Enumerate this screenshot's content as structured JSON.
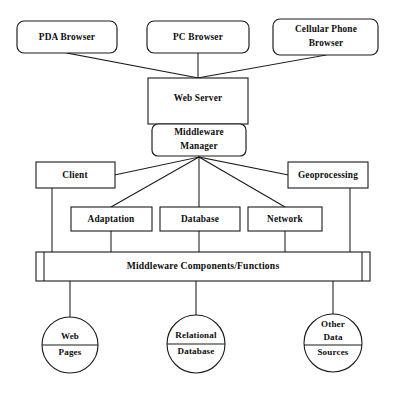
{
  "diagram": {
    "style": {
      "background": "#ffffff",
      "stroke": "#1a1a1a",
      "fill": "#ffffff",
      "text": "#0d0d0d"
    },
    "clients": [
      {
        "id": "pda-browser",
        "label": "PDA Browser",
        "shape": "rounded-rect"
      },
      {
        "id": "pc-browser",
        "label": "PC Browser",
        "shape": "rounded-rect"
      },
      {
        "id": "cellular-phone-browser",
        "label_line1": "Cellular Phone",
        "label_line2": "Browser",
        "shape": "rounded-rect"
      }
    ],
    "server": {
      "id": "web-server",
      "label": "Web Server",
      "shape": "rect"
    },
    "manager": {
      "id": "middleware-manager",
      "label_line1": "Middleware",
      "label_line2": "Manager",
      "shape": "rounded-rect"
    },
    "services": [
      {
        "id": "client",
        "label": "Client",
        "shape": "rect"
      },
      {
        "id": "adaptation",
        "label": "Adaptation",
        "shape": "rect"
      },
      {
        "id": "database",
        "label": "Database",
        "shape": "rect"
      },
      {
        "id": "network",
        "label": "Network",
        "shape": "rect"
      },
      {
        "id": "geoprocessing",
        "label": "Geoprocessing",
        "shape": "rect"
      }
    ],
    "components_bar": {
      "id": "middleware-components-functions",
      "label": "Middleware Components/Functions",
      "shape": "process-bar"
    },
    "data_stores": [
      {
        "id": "web-pages",
        "label_line1": "Web",
        "label_line2": "Pages",
        "shape": "circle-divided"
      },
      {
        "id": "relational-database",
        "label_line1": "Relational",
        "label_line2": "Database",
        "shape": "circle-divided"
      },
      {
        "id": "other-data-sources",
        "label_line1": "Other",
        "label_line2": "Data",
        "label_line3": "Sources",
        "shape": "circle-divided"
      }
    ]
  }
}
